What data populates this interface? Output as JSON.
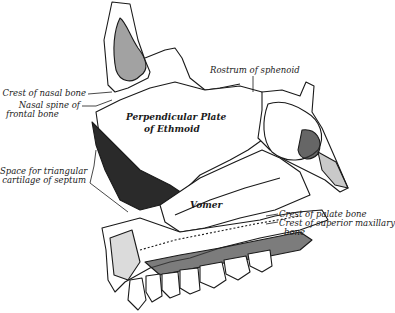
{
  "figure": {
    "labels": {
      "crest_nasal": "Crest of nasal bone",
      "nasal_spine_1": "Nasal spine of",
      "nasal_spine_2": "frontal bone",
      "space_1": "Space for triangular",
      "space_2": "cartilage of septum",
      "rostrum": "Rostrum of sphenoid",
      "perp_1": "Perpendicular Plate",
      "perp_2": "of Ethmoid",
      "vomer": "Vomer",
      "crest_palate": "Crest of palate bone",
      "crest_maxilla_1": "Crest of superior maxillary",
      "crest_maxilla_2": "bone"
    },
    "colors": {
      "ink": "#1a1a1a",
      "shade": "#3a3a3a",
      "background": "#ffffff"
    }
  }
}
